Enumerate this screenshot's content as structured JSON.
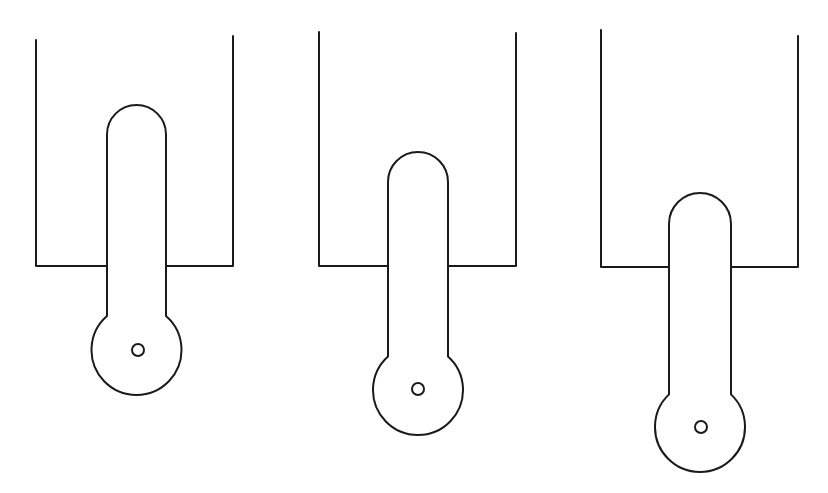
{
  "figure": {
    "stroke_color": "#1a1a1a",
    "background": "#ffffff",
    "panels": [
      {
        "id": "panel-1",
        "container": {
          "left_x": 36,
          "right_x": 233,
          "left_top_y": 40,
          "right_top_y": 36,
          "floor_y": 266
        },
        "rod": {
          "left_x": 107,
          "right_x": 166,
          "top_y": 105,
          "neck_y": 315
        },
        "bulb": {
          "cx": 137,
          "cy": 350,
          "r": 45
        },
        "hole": {
          "cx": 138,
          "cy": 350,
          "r": 6
        }
      },
      {
        "id": "panel-2",
        "container": {
          "left_x": 319,
          "right_x": 516,
          "left_top_y": 32,
          "right_top_y": 33,
          "floor_y": 266
        },
        "rod": {
          "left_x": 388,
          "right_x": 448,
          "top_y": 152,
          "neck_y": 353
        },
        "bulb": {
          "cx": 418,
          "cy": 390,
          "r": 45
        },
        "hole": {
          "cx": 418,
          "cy": 389,
          "r": 6
        }
      },
      {
        "id": "panel-3",
        "container": {
          "left_x": 601,
          "right_x": 798,
          "left_top_y": 30,
          "right_top_y": 36,
          "floor_y": 267
        },
        "rod": {
          "left_x": 669,
          "right_x": 731,
          "top_y": 193,
          "neck_y": 392
        },
        "bulb": {
          "cx": 701,
          "cy": 427,
          "r": 45
        },
        "hole": {
          "cx": 701,
          "cy": 427,
          "r": 6
        }
      }
    ]
  }
}
